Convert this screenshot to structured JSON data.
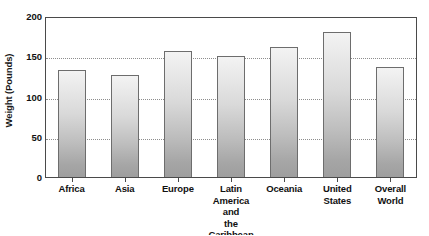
{
  "chart_data": {
    "type": "bar",
    "title": "",
    "xlabel": "",
    "ylabel": "Weight (Pounds)",
    "ylim": [
      0,
      200
    ],
    "yticks": [
      0,
      50,
      100,
      150,
      200
    ],
    "grid": "horizontal-dotted",
    "legend": "none",
    "categories": [
      "Africa",
      "Asia",
      "Europe",
      "Latin America and the Caribbean",
      "Oceania",
      "United States",
      "Overall World"
    ],
    "category_lines": [
      [
        "Africa"
      ],
      [
        "Asia"
      ],
      [
        "Europe"
      ],
      [
        "Latin",
        "America and",
        "the Caribbean"
      ],
      [
        "Oceania"
      ],
      [
        "United",
        "States"
      ],
      [
        "Overall",
        "World"
      ]
    ],
    "values": [
      133,
      127,
      156,
      150,
      162,
      180,
      137
    ],
    "bar_color": "#cfcfcf",
    "bar_border_color": "#6d6d6d",
    "axis_color": "#4a4a4a",
    "gridline_color": "#8d8d8d",
    "text_color": "#111111"
  }
}
